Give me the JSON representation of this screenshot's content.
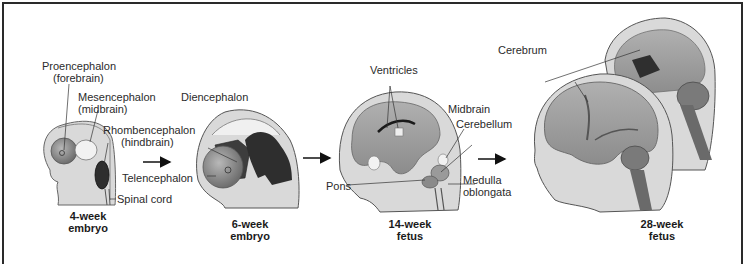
{
  "figure": {
    "stages": [
      {
        "caption_line1": "4-week",
        "caption_line2": "embryo"
      },
      {
        "caption_line1": "6-week",
        "caption_line2": "embryo"
      },
      {
        "caption_line1": "14-week",
        "caption_line2": "fetus"
      },
      {
        "caption_line1": "28-week",
        "caption_line2": "fetus"
      }
    ],
    "labels": {
      "proencephalon_1": "Proencephalon",
      "proencephalon_2": "(forebrain)",
      "mesencephalon_1": "Mesencephalon",
      "mesencephalon_2": "(midbrain)",
      "rhombencephalon_1": "Rhombencephalon",
      "rhombencephalon_2": "(hindbrain)",
      "spinal_cord": "Spinal cord",
      "diencephalon": "Diencephalon",
      "telencephalon": "Telencephalon",
      "ventricles": "Ventricles",
      "midbrain": "Midbrain",
      "cerebellum": "Cerebellum",
      "pons": "Pons",
      "medulla_1": "Medulla",
      "medulla_2": "oblongata",
      "cerebrum": "Cerebrum"
    },
    "arrows": [
      "arrow-4wk-to-6wk",
      "arrow-6wk-to-14wk",
      "arrow-14wk-to-28wk"
    ],
    "colors": {
      "border": "#2a2a2a",
      "head_fill": "#d9d9d9",
      "head_outline": "#555555",
      "brain_mid": "#a6a6a6",
      "brain_dark": "#3a3a3a",
      "brain_light": "#f0f0f0"
    }
  }
}
